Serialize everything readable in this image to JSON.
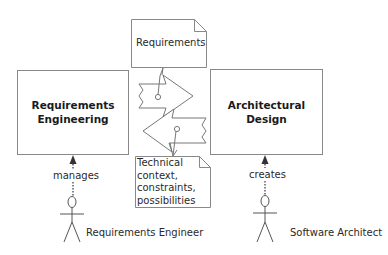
{
  "diagram": {
    "activities": [
      {
        "id": "requirements-engineering",
        "title_line1": "Requirements",
        "title_line2": "Engineering"
      },
      {
        "id": "architectural-design",
        "title_line1": "Architectural",
        "title_line2": "Design"
      }
    ],
    "artifacts": {
      "requirements_note": "Requirements",
      "technical_note": {
        "line1": "Technical",
        "line2": "context,",
        "line3": "constraints,",
        "line4": "possibilities"
      }
    },
    "relations": {
      "manages": "manages",
      "creates": "creates"
    },
    "actors": [
      {
        "id": "requirements-engineer",
        "label": "Requirements Engineer"
      },
      {
        "id": "software-architect",
        "label": "Software Architect"
      }
    ],
    "colors": {
      "stroke": "#777777",
      "text": "#222222",
      "background": "#ffffff"
    }
  }
}
